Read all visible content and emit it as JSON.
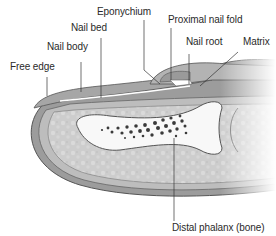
{
  "labels": {
    "free_edge": "Free edge",
    "nail_body": "Nail body",
    "nail_bed": "Nail bed",
    "eponychium": "Eponychium",
    "proximal_nail_fold": "Proximal nail fold",
    "nail_root": "Nail root",
    "matrix": "Matrix",
    "distal_phalanx": "Distal phalanx (bone)"
  },
  "colors": {
    "background": "#ffffff",
    "skin_outline": "#5a5a5a",
    "nail": "#a9a9a9",
    "tissue": "#cfcfcf",
    "bone": "#f7f7f7",
    "marrow": "#3a3a3a",
    "leader_line": "#333333",
    "label_text": "#2a2a2a"
  }
}
